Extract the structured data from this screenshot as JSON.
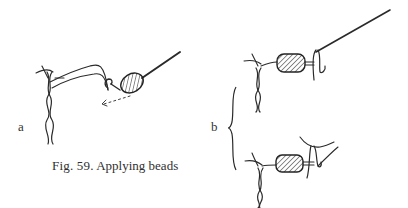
{
  "figure": {
    "caption_prefix": "Fig. 59.",
    "caption_text": " Applying beads",
    "panels": [
      {
        "id": "a",
        "label": "a",
        "description": "needle with thread passed through a single bead, arrow showing direction toward the twisted cord"
      },
      {
        "id": "b",
        "label": "b",
        "description": "two steps: bead on thread with needle looped through; bead secured with loop held by finger"
      }
    ],
    "colors": {
      "ink": "#2a2a2a",
      "background": "#ffffff"
    }
  }
}
